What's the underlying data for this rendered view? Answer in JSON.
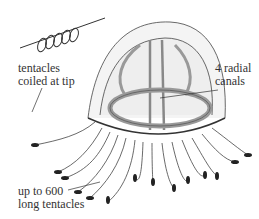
{
  "diagram": {
    "labels": {
      "coiled": {
        "line1": "tentacles",
        "line2": "coiled at tip"
      },
      "canals": {
        "line1": "4 radial",
        "line2": "canals"
      },
      "tentacles": {
        "line1": "up to 600",
        "line2": "long tentacles"
      }
    },
    "colors": {
      "ink": "#333333",
      "fill": "#e8e8e8",
      "background": "#ffffff"
    }
  }
}
